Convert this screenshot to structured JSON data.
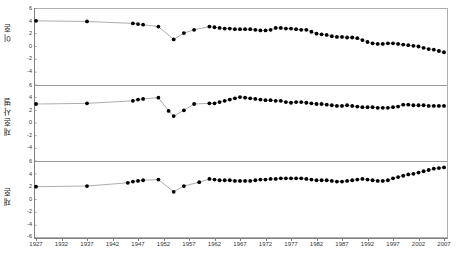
{
  "chart_data": [
    {
      "type": "line",
      "panel_index": 0,
      "title": "",
      "ylabel": "이혼",
      "xlabel": "",
      "ylim": [
        -6,
        6
      ],
      "xlim": [
        1927,
        2007
      ],
      "yticks": [
        6,
        4,
        2,
        0,
        -2,
        -4,
        -6
      ],
      "grid": false,
      "legend": "none",
      "marker": "filled-circle",
      "x": [
        1927,
        1937,
        1946,
        1947,
        1948,
        1951,
        1954,
        1956,
        1958,
        1961,
        1962,
        1963,
        1964,
        1965,
        1966,
        1967,
        1968,
        1969,
        1970,
        1971,
        1972,
        1973,
        1974,
        1975,
        1976,
        1977,
        1978,
        1979,
        1980,
        1981,
        1982,
        1983,
        1984,
        1985,
        1986,
        1987,
        1988,
        1989,
        1990,
        1991,
        1992,
        1993,
        1994,
        1995,
        1996,
        1997,
        1998,
        1999,
        2000,
        2001,
        2002,
        2003,
        2004,
        2005,
        2006,
        2007
      ],
      "y": [
        4.0,
        3.9,
        3.6,
        3.5,
        3.4,
        3.1,
        1.1,
        2.1,
        2.6,
        3.1,
        3.0,
        2.9,
        2.8,
        2.8,
        2.7,
        2.7,
        2.7,
        2.7,
        2.6,
        2.5,
        2.5,
        2.6,
        2.9,
        2.9,
        2.8,
        2.8,
        2.7,
        2.6,
        2.6,
        2.3,
        2.0,
        1.9,
        1.8,
        1.6,
        1.5,
        1.5,
        1.4,
        1.4,
        1.3,
        1.0,
        0.7,
        0.5,
        0.4,
        0.4,
        0.5,
        0.5,
        0.4,
        0.3,
        0.2,
        0.1,
        0.0,
        -0.2,
        -0.4,
        -0.5,
        -0.7,
        -0.9
      ]
    },
    {
      "type": "line",
      "panel_index": 1,
      "title": "",
      "ylabel": "재혼사별",
      "xlabel": "",
      "ylim": [
        -6,
        6
      ],
      "xlim": [
        1927,
        2007
      ],
      "yticks": [
        6,
        4,
        2,
        0,
        -2,
        -4,
        -6
      ],
      "grid": false,
      "legend": "none",
      "marker": "filled-circle",
      "x": [
        1927,
        1937,
        1946,
        1947,
        1948,
        1951,
        1953,
        1954,
        1956,
        1958,
        1961,
        1962,
        1963,
        1964,
        1965,
        1966,
        1967,
        1968,
        1969,
        1970,
        1971,
        1972,
        1973,
        1974,
        1975,
        1976,
        1977,
        1978,
        1979,
        1980,
        1981,
        1982,
        1983,
        1984,
        1985,
        1986,
        1987,
        1988,
        1989,
        1990,
        1991,
        1992,
        1993,
        1994,
        1995,
        1996,
        1997,
        1998,
        1999,
        2000,
        2001,
        2002,
        2003,
        2004,
        2005,
        2006,
        2007
      ],
      "y": [
        3.0,
        3.1,
        3.5,
        3.7,
        3.8,
        4.0,
        1.9,
        1.1,
        2.0,
        3.0,
        3.1,
        3.1,
        3.3,
        3.5,
        3.7,
        3.9,
        4.1,
        4.0,
        3.9,
        3.8,
        3.7,
        3.6,
        3.6,
        3.5,
        3.5,
        3.3,
        3.2,
        3.3,
        3.3,
        3.2,
        3.1,
        3.0,
        3.0,
        2.9,
        2.8,
        2.7,
        2.7,
        2.8,
        2.7,
        2.6,
        2.5,
        2.5,
        2.5,
        2.4,
        2.4,
        2.4,
        2.5,
        2.6,
        2.9,
        2.9,
        2.8,
        2.8,
        2.8,
        2.7,
        2.7,
        2.7,
        2.7
      ]
    },
    {
      "type": "line",
      "panel_index": 2,
      "title": "",
      "ylabel": "재혼",
      "xlabel": "",
      "ylim": [
        -6,
        6
      ],
      "xlim": [
        1927,
        2007
      ],
      "yticks": [
        6,
        4,
        2,
        0,
        -2,
        -4,
        -6
      ],
      "grid": false,
      "legend": "none",
      "marker": "filled-circle",
      "x": [
        1927,
        1937,
        1945,
        1946,
        1947,
        1948,
        1951,
        1954,
        1956,
        1959,
        1961,
        1962,
        1963,
        1964,
        1965,
        1966,
        1967,
        1968,
        1969,
        1970,
        1971,
        1972,
        1973,
        1974,
        1975,
        1976,
        1977,
        1978,
        1979,
        1980,
        1981,
        1982,
        1983,
        1984,
        1985,
        1986,
        1987,
        1988,
        1989,
        1990,
        1991,
        1992,
        1993,
        1994,
        1995,
        1996,
        1997,
        1998,
        1999,
        2000,
        2001,
        2002,
        2003,
        2004,
        2005,
        2006,
        2007
      ],
      "y": [
        2.0,
        2.1,
        2.6,
        2.8,
        2.9,
        3.0,
        3.1,
        1.2,
        2.1,
        2.7,
        3.2,
        3.1,
        3.0,
        3.0,
        3.0,
        2.9,
        2.9,
        2.9,
        2.9,
        3.0,
        3.1,
        3.1,
        3.2,
        3.2,
        3.3,
        3.3,
        3.3,
        3.3,
        3.3,
        3.2,
        3.1,
        3.0,
        3.0,
        3.0,
        2.9,
        2.8,
        2.8,
        2.9,
        3.0,
        3.1,
        3.2,
        3.1,
        3.0,
        2.9,
        2.9,
        3.0,
        3.3,
        3.5,
        3.7,
        3.9,
        4.0,
        4.2,
        4.4,
        4.6,
        4.8,
        4.9,
        5.0
      ]
    }
  ],
  "axes": {
    "y_tick_labels": [
      "6",
      "4",
      "2",
      "0",
      "-2",
      "-4",
      "-6"
    ],
    "x_tick_labels": [
      "1927",
      "1932",
      "1937",
      "1942",
      "1947",
      "1952",
      "1957",
      "1962",
      "1967",
      "1972",
      "1977",
      "1982",
      "1987",
      "1992",
      "1997",
      "2002",
      "2007"
    ]
  },
  "panel_titles": {
    "top": "이혼",
    "middle": "재혼사별",
    "bottom": "재혼"
  },
  "colors": {
    "marker": "#000000",
    "line": "#8a8a8a",
    "axis": "#808080",
    "frame": "#b0b0b0",
    "text": "#222222"
  }
}
